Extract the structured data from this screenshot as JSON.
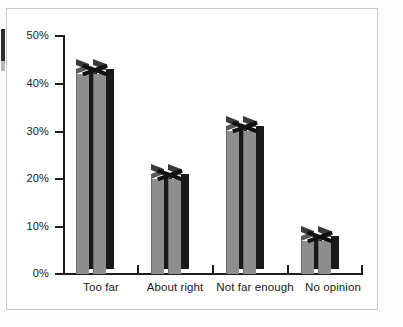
{
  "chart_data": {
    "type": "bar",
    "title": "",
    "subtitle": "",
    "xlabel": "",
    "ylabel": "",
    "categories": [
      "Too far",
      "About right",
      "Not far enough",
      "No opinion"
    ],
    "values": [
      42,
      20,
      30,
      7
    ],
    "value_labels": [
      "42%",
      "20%",
      "30%",
      "7%"
    ],
    "ylim": [
      0,
      50
    ],
    "ytick_labels": [
      "0%",
      "10%",
      "20%",
      "30%",
      "40%",
      "50%"
    ],
    "ytick_values": [
      0,
      10,
      20,
      30,
      40,
      50
    ],
    "grid": false,
    "legend": "none",
    "series": [
      {
        "name": "Share of respondents",
        "values": [
          42,
          20,
          30,
          7
        ]
      }
    ],
    "style": {
      "bar_style": "3d-column",
      "bar_face_color": "#8e8e8e",
      "bar_side_color": "#191919",
      "axis_color": "#1d1d1d",
      "panel_background": "#ffffff",
      "panel_border_color": "#c9c9c9",
      "page_background": "#fdfdfd",
      "text_color": "#1a1a1a"
    }
  },
  "axes": {
    "y_ticks": [
      {
        "label": "50%",
        "value": 50
      },
      {
        "label": "40%",
        "value": 40
      },
      {
        "label": "30%",
        "value": 30
      },
      {
        "label": "20%",
        "value": 20
      },
      {
        "label": "10%",
        "value": 10
      },
      {
        "label": "0%",
        "value": 0
      }
    ],
    "x_categories": [
      {
        "label": "Too far"
      },
      {
        "label": "About right"
      },
      {
        "label": "Not far enough"
      },
      {
        "label": "No opinion"
      }
    ]
  },
  "artifacts": {
    "left_edge_mark": "scan-artifact"
  }
}
